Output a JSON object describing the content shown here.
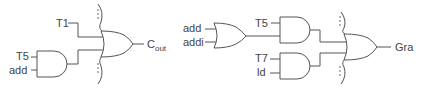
{
  "left_circuit": {
    "inputs": {
      "t1": "T1",
      "t5": "T5",
      "add": "add"
    },
    "output": {
      "main": "C",
      "subscript": "out"
    },
    "gates": [
      "AND(T5, add)",
      "OR(T1, AND, ...)"
    ]
  },
  "right_circuit": {
    "inputs": {
      "add": "add",
      "addi": "addi",
      "t5": "T5",
      "t7": "T7",
      "ld": "ld"
    },
    "output": {
      "main": "Gra"
    },
    "gates": [
      "OR(add, addi)",
      "AND(T5, OR)",
      "AND(T7, ld)",
      "OR(AND1, AND2, ...)"
    ]
  },
  "colors": {
    "line": "#555555",
    "text": "#444444",
    "background": "#ffffff"
  }
}
